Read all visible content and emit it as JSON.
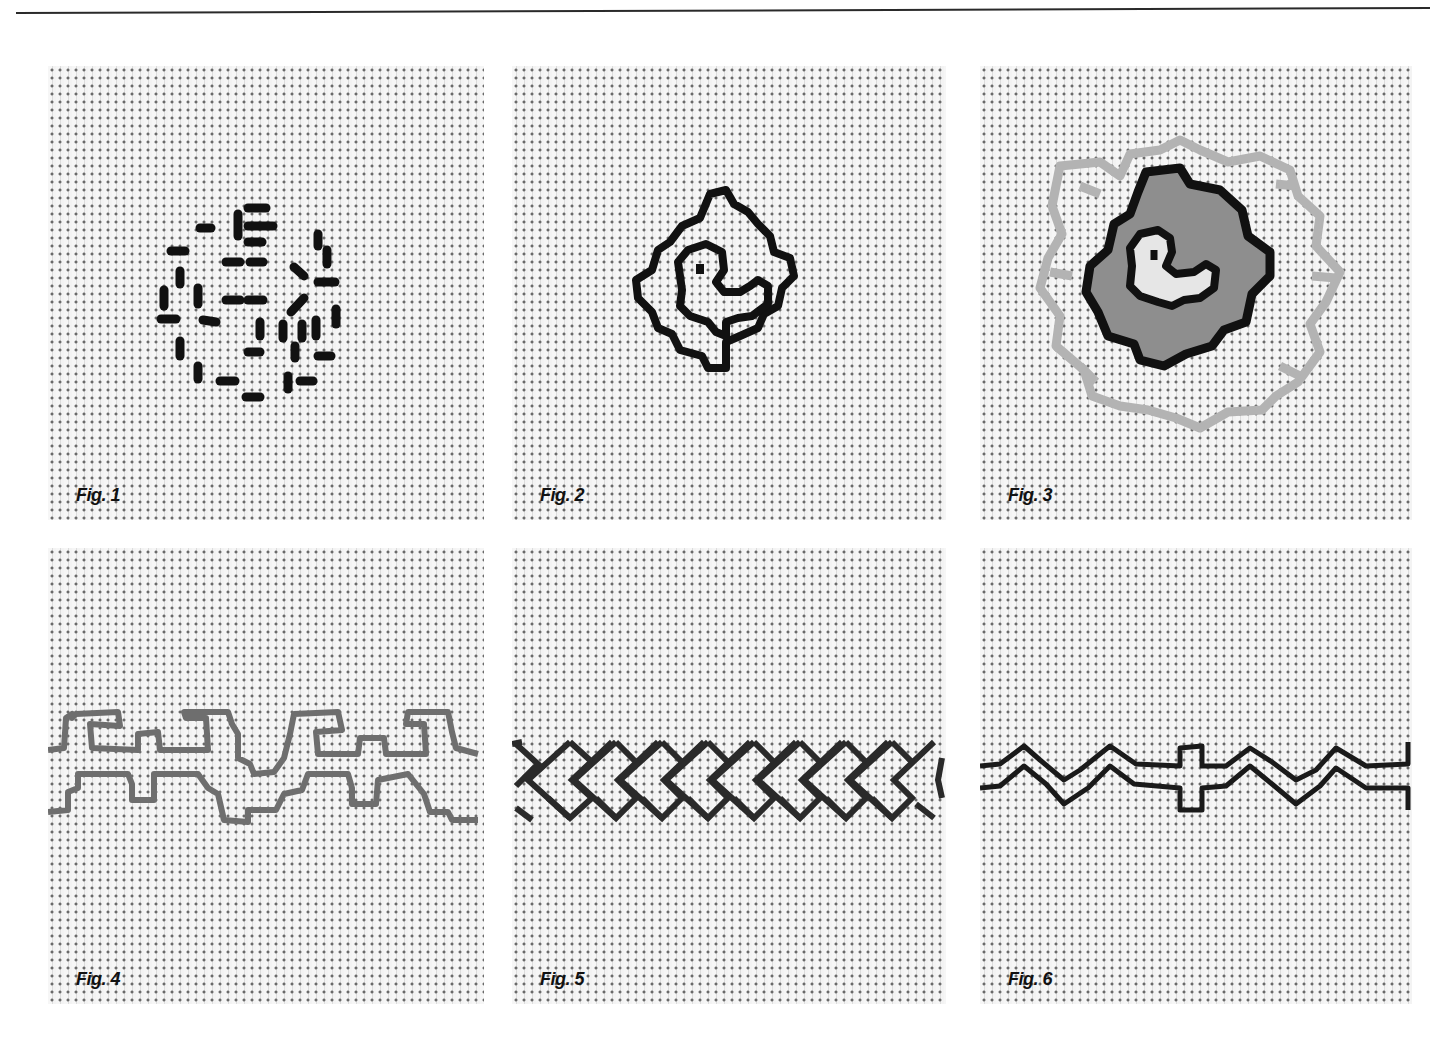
{
  "page": {
    "has_top_rule": true
  },
  "figures": [
    {
      "label": "Fig. 1",
      "motif": "scattered-running-stitches-circle",
      "thread_color": "#111111"
    },
    {
      "label": "Fig. 2",
      "motif": "stepped-outline-bird-medallion",
      "thread_color": "#111111"
    },
    {
      "label": "Fig. 3",
      "motif": "filled-bird-medallion-with-light-border",
      "thread_color": "#111111",
      "fill_color": "#8c8c8c",
      "border_color": "#b4b4b4"
    },
    {
      "label": "Fig. 4",
      "motif": "stepped-meander-border",
      "thread_color": "#6e6e6e"
    },
    {
      "label": "Fig. 5",
      "motif": "interlaced-chevron-border",
      "thread_color": "#2a2a2a"
    },
    {
      "label": "Fig. 6",
      "motif": "double-zigzag-with-cross-border",
      "thread_color": "#1a1a1a"
    }
  ]
}
